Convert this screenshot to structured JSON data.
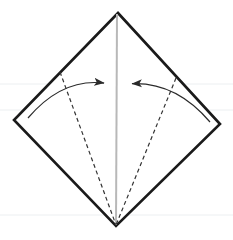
{
  "figure": {
    "type": "diagram",
    "width": 233,
    "height": 240,
    "background_color": "#ffffff"
  },
  "colors": {
    "outline": "#1a1a1a",
    "crease_center": "#b8b8b8",
    "fold_dashed": "#333333",
    "arrow": "#2b2b2b",
    "ruling": "#eceff1"
  },
  "shapes": {
    "square_diamond": {
      "name": "paper-outline",
      "description": "Square sheet rotated 45 degrees, kite/diamond orientation",
      "stroke_width": 2.6,
      "points": [
        {
          "label": "top",
          "x": 118,
          "y": 13
        },
        {
          "label": "right",
          "x": 220,
          "y": 124
        },
        {
          "label": "bottom",
          "x": 116,
          "y": 226
        },
        {
          "label": "left",
          "x": 14,
          "y": 120
        }
      ]
    },
    "center_crease": {
      "name": "center-vertical-crease",
      "stroke_width": 2.0,
      "x1": 117,
      "y1": 14,
      "x2": 116,
      "y2": 225
    },
    "fold_lines": [
      {
        "name": "left-fold-line",
        "stroke_width": 1.2,
        "dash": "4,3",
        "x1": 60,
        "y1": 72,
        "x2": 116,
        "y2": 225
      },
      {
        "name": "right-fold-line",
        "stroke_width": 1.2,
        "dash": "4,3",
        "x1": 176,
        "y1": 78,
        "x2": 116,
        "y2": 225
      }
    ],
    "arrows": [
      {
        "name": "left-fold-arrow",
        "direction": "right-inward",
        "stroke_width": 1.2,
        "start_x": 28,
        "start_y": 118,
        "ctrl_x": 62,
        "ctrl_y": 78,
        "end_x": 112,
        "end_y": 84,
        "head_x": 112,
        "head_y": 84
      },
      {
        "name": "right-fold-arrow",
        "direction": "left-inward",
        "stroke_width": 1.2,
        "start_x": 210,
        "start_y": 122,
        "ctrl_x": 176,
        "ctrl_y": 82,
        "end_x": 124,
        "end_y": 84,
        "head_x": 124,
        "head_y": 84
      }
    ],
    "rulings": [
      {
        "name": "ruling-line-upper",
        "y": 84,
        "x1": 0,
        "x2": 233
      },
      {
        "name": "ruling-line-middle",
        "y": 110,
        "x1": 0,
        "x2": 233
      },
      {
        "name": "ruling-line-lower",
        "y": 215,
        "x1": 0,
        "x2": 233
      }
    ]
  },
  "labels": {
    "alt_text": "Diamond-shaped paper with a vertical center crease and two dashed diagonal fold lines meeting at the bottom point, with two curved arrows pointing inward toward the center."
  }
}
